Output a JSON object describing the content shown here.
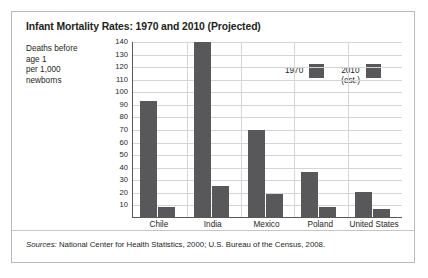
{
  "chart_data": {
    "type": "bar",
    "title": "Infant Mortality Rates: 1970 and 2010 (Projected)",
    "categories": [
      "Chile",
      "India",
      "Mexico",
      "Poland",
      "United States"
    ],
    "series": [
      {
        "name": "1970",
        "values": [
          92,
          139,
          69,
          36,
          20
        ],
        "color": "#58585a"
      },
      {
        "name": "2010 (est.)",
        "values": [
          8,
          25,
          18,
          8,
          6
        ],
        "color": "#58585a"
      }
    ],
    "legend": [
      {
        "line1": "1970",
        "line2": ""
      },
      {
        "line1": "2010",
        "line2": "(est.)"
      }
    ],
    "ylabel_lines": [
      "Deaths before",
      "age 1",
      "per 1,000",
      "newborns"
    ],
    "xlabel": "",
    "ylim": [
      0,
      140
    ],
    "yticks": [
      140,
      130,
      120,
      110,
      100,
      90,
      80,
      70,
      60,
      50,
      40,
      30,
      20,
      10
    ],
    "grid": true,
    "legend_position": "inside-top-center"
  },
  "source": {
    "label": "Sources:",
    "text": " National Center for Health Statistics, 2000; U.S. Bureau of the Census, 2008."
  }
}
